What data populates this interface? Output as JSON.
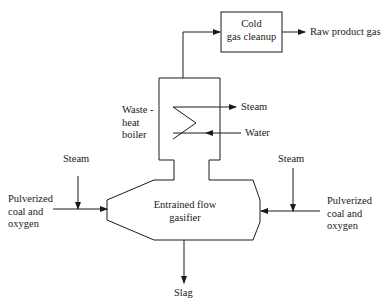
{
  "diagram": {
    "type": "process-flow",
    "nodes": {
      "cold_gas_cleanup": {
        "line1": "Cold",
        "line2": "gas cleanup"
      },
      "waste_heat_boiler": {
        "line1": "Waste -",
        "line2": "heat",
        "line3": "boiler"
      },
      "gasifier": {
        "line1": "Entrained flow",
        "line2": "gasifier"
      }
    },
    "streams": {
      "raw_product_gas": "Raw product gas",
      "boiler_steam_out": "Steam",
      "boiler_water_in": "Water",
      "steam_left": "Steam",
      "steam_right": "Steam",
      "feed_left": {
        "line1": "Pulverized",
        "line2": "coal and",
        "line3": "oxygen"
      },
      "feed_right": {
        "line1": "Pulverized",
        "line2": "coal and",
        "line3": "oxygen"
      },
      "slag": "Slag"
    },
    "colors": {
      "line": "#1a1a1a",
      "background": "#ffffff"
    }
  }
}
